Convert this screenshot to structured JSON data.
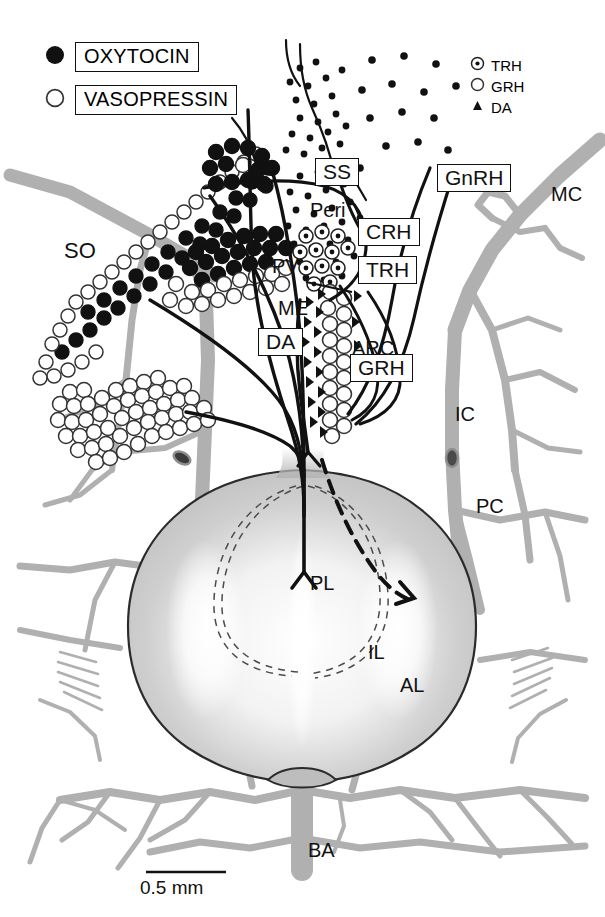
{
  "figure": {
    "kind": "neuroanatomical-diagram",
    "scale_bar": {
      "label": "0.5 mm"
    }
  },
  "legend_main": {
    "items": [
      {
        "key": "filled-circle",
        "label": "OXYTOCIN"
      },
      {
        "key": "open-circle",
        "label": "VASOPRESSIN"
      }
    ]
  },
  "legend_secondary": {
    "items": [
      {
        "key": "dotted-circle",
        "label": "TRH"
      },
      {
        "key": "open-circle",
        "label": "GRH"
      },
      {
        "key": "filled-triangle",
        "label": "DA"
      }
    ]
  },
  "boxed_labels": [
    {
      "id": "ss",
      "label": "SS"
    },
    {
      "id": "gnrh",
      "label": "GnRH"
    },
    {
      "id": "crh",
      "label": "CRH"
    },
    {
      "id": "trh",
      "label": "TRH"
    },
    {
      "id": "da",
      "label": "DA"
    },
    {
      "id": "grh",
      "label": "GRH"
    }
  ],
  "plain_labels": [
    {
      "id": "so",
      "label": "SO"
    },
    {
      "id": "peri",
      "label": "Peri"
    },
    {
      "id": "pv",
      "label": "PV"
    },
    {
      "id": "me",
      "label": "ME"
    },
    {
      "id": "arc",
      "label": "ARC"
    },
    {
      "id": "mc",
      "label": "MC"
    },
    {
      "id": "ic",
      "label": "IC"
    },
    {
      "id": "pc",
      "label": "PC"
    },
    {
      "id": "pl",
      "label": "PL"
    },
    {
      "id": "il",
      "label": "IL"
    },
    {
      "id": "al",
      "label": "AL"
    },
    {
      "id": "ba",
      "label": "BA"
    }
  ],
  "colors": {
    "ink": "#111111",
    "vessel": "#b0b0b0",
    "vessel_dark": "#9a9a9a",
    "gland": "#c2c2c2",
    "gland_highlight": "#ffffff",
    "background": "#ffffff"
  }
}
